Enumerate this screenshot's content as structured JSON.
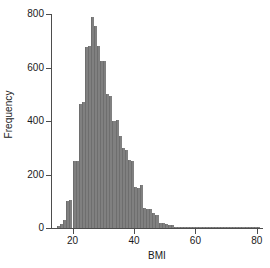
{
  "chart_data": {
    "type": "bar",
    "title": "",
    "subtitle": "",
    "xlabel": "BMI",
    "ylabel": "Frequency",
    "xlim": [
      13,
      82
    ],
    "ylim": [
      0,
      800
    ],
    "xticks": [
      20,
      40,
      60,
      80
    ],
    "yticks": [
      0,
      200,
      400,
      600,
      800
    ],
    "grid": false,
    "legend": null,
    "bin_width": 1,
    "bar_color": "#808080",
    "axis_color": "#4d4d4d",
    "categories": [
      15,
      16,
      17,
      18,
      19,
      20,
      21,
      22,
      23,
      24,
      25,
      26,
      27,
      28,
      29,
      30,
      31,
      32,
      33,
      34,
      35,
      36,
      37,
      38,
      39,
      40,
      41,
      42,
      43,
      44,
      45,
      46,
      47,
      48,
      49,
      50,
      51,
      52,
      53,
      54,
      55,
      56,
      57,
      58,
      59,
      60,
      61,
      62,
      63,
      64,
      65,
      66,
      67,
      68,
      69,
      70,
      71,
      72,
      73,
      74,
      75,
      76,
      77,
      78,
      79,
      80
    ],
    "values": [
      8,
      14,
      30,
      100,
      105,
      250,
      250,
      465,
      470,
      675,
      680,
      790,
      755,
      680,
      625,
      625,
      500,
      495,
      400,
      405,
      345,
      300,
      290,
      255,
      250,
      155,
      150,
      160,
      75,
      70,
      70,
      55,
      50,
      20,
      18,
      14,
      12,
      10,
      3,
      2,
      1,
      1,
      1,
      1,
      1,
      3,
      1,
      1,
      1,
      1,
      1,
      1,
      2,
      2,
      1,
      1,
      1,
      1,
      1,
      1,
      1,
      1,
      1,
      1,
      1,
      2
    ]
  },
  "axes": {
    "y_label": "Frequency",
    "x_label": "BMI",
    "y_tick_labels": [
      "800",
      "600",
      "400",
      "200",
      "0"
    ],
    "x_tick_labels": [
      "20",
      "40",
      "60",
      "80"
    ]
  }
}
